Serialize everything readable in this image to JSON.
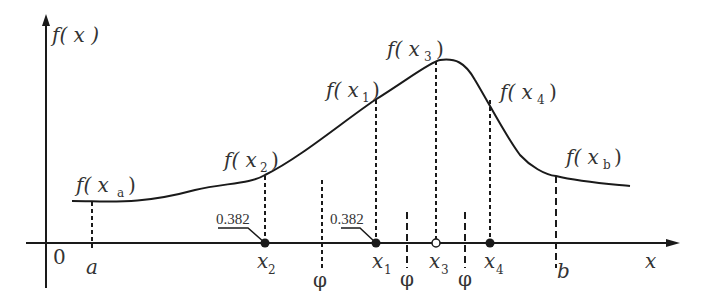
{
  "figure": {
    "type": "golden-section search illustration",
    "axes": {
      "x_label": "x",
      "y_label": "f( x )",
      "origin_label": "0"
    },
    "x_points": {
      "a": "a",
      "x2": "x",
      "x2_sub": "2",
      "x1": "x",
      "x1_sub": "1",
      "x3": "x",
      "x3_sub": "3",
      "x4": "x",
      "x4_sub": "4",
      "b": "b"
    },
    "function_labels": {
      "fxa": "f( x",
      "fxa_sub": "a",
      "fx2": "f( x",
      "fx2_sub": "2",
      "fx1": "f( x",
      "fx1_sub": "1",
      "fx3": "f( x",
      "fx3_sub": "3",
      "fx4": "f( x",
      "fx4_sub": "4",
      "fxb": "f( x",
      "fxb_sub": "b",
      "close_paren": ")"
    },
    "ratio_labels": {
      "left": "0.382",
      "right": "0.382"
    },
    "symmetry_marks": {
      "mark1": "φ",
      "mark2": "φ",
      "mark3": "φ"
    },
    "marker_styles": {
      "x2": "filled",
      "x1": "filled",
      "x3": "hollow",
      "x4": "filled"
    },
    "colors": {
      "ink": "#1a1a1a",
      "text": "#333333",
      "background": "#ffffff"
    }
  }
}
